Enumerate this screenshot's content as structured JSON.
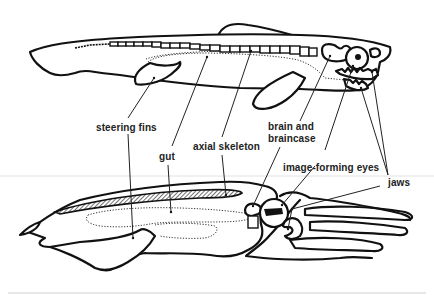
{
  "diagram": {
    "title": "",
    "top_figure": "fish (vertebrate) body plan",
    "bottom_figure": "squid (cephalopod) body plan",
    "labels": {
      "steering_fins": "steering fins",
      "gut": "gut",
      "axial_skeleton": "axial skeleton",
      "brain_line1": "brain and",
      "brain_line2": "braincase",
      "eyes": "image-forming eyes",
      "jaws": "jaws"
    },
    "colors": {
      "background": "#ffffff",
      "ink": "#111111",
      "divider": "#d0d0d0"
    }
  }
}
